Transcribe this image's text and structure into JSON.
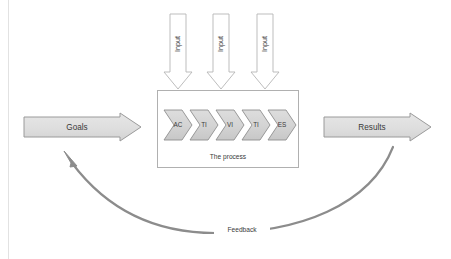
{
  "diagram": {
    "title_visible": false,
    "background_color": "#ffffff",
    "margin_rule_color": "#e2e2e2"
  },
  "colors": {
    "block_fill": "#dedede",
    "block_stroke": "#9a9a9a",
    "chevron_fill": "#d4d4d4",
    "chevron_stroke": "#8f8f8f",
    "input_fill": "#ffffff",
    "input_stroke": "#b5b5b5",
    "process_box_stroke": "#b0b0b0",
    "feedback_arrow": "#8c8c8c",
    "text": "#3a3a3a"
  },
  "blocks": {
    "goals": {
      "label": "Goals",
      "icon": "right-arrow-block"
    },
    "results": {
      "label": "Results",
      "icon": "right-arrow-block"
    }
  },
  "process": {
    "caption": "The process",
    "steps": [
      {
        "label": "AC"
      },
      {
        "label": "TI"
      },
      {
        "label": "VI"
      },
      {
        "label": "TI"
      },
      {
        "label": "ES"
      }
    ]
  },
  "inputs": [
    {
      "label": "Input"
    },
    {
      "label": "Input"
    },
    {
      "label": "Input"
    }
  ],
  "feedback": {
    "label": "Feedback",
    "icon": "curved-arrow-icon",
    "direction": "results-to-goals"
  }
}
